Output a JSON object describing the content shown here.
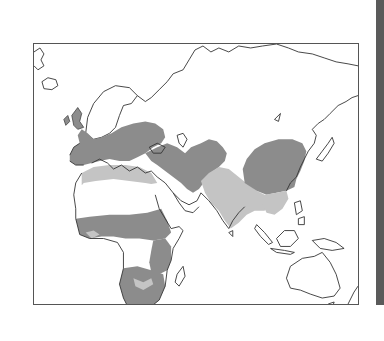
{
  "map": {
    "type": "distribution-range-map",
    "region": "Europe, Africa, Asia, Australia (Old World)",
    "colors": {
      "primary_range": "#8c8c8c",
      "secondary_range": "#c4c4c4",
      "land": "#ffffff",
      "coastline": "#333333",
      "frame": "#555555",
      "side_bar": "#5a5a5a"
    },
    "legend": [],
    "labels": []
  }
}
